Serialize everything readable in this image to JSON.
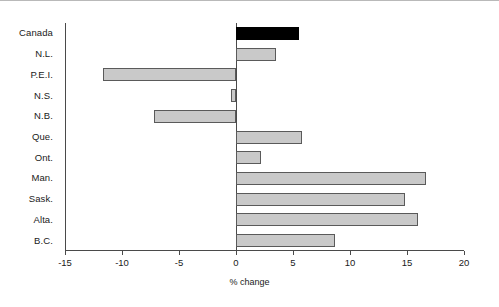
{
  "chart_data": {
    "type": "bar",
    "orientation": "horizontal",
    "title": "",
    "xlabel": "% change",
    "ylabel": "",
    "xlim": [
      -15,
      20
    ],
    "xticks": [
      -15,
      -10,
      -5,
      0,
      5,
      10,
      15,
      20
    ],
    "xtick_labels": [
      "-15",
      "-10",
      "-5",
      "0",
      "5",
      "10",
      "15",
      "20"
    ],
    "grid": false,
    "legend": false,
    "zero_reference": 0,
    "highlight_category": "Canada",
    "colors": {
      "bar_fill": "#c9c9c9",
      "bar_edge": "#5a5a5a",
      "highlight_fill": "#000000",
      "axis": "#4a4a4a",
      "text": "#1a1a1a"
    },
    "categories": [
      "Canada",
      "N.L.",
      "P.E.I.",
      "N.S.",
      "N.B.",
      "Que.",
      "Ont.",
      "Man.",
      "Sask.",
      "Alta.",
      "B.C."
    ],
    "values": [
      5.5,
      3.5,
      -11.7,
      -0.4,
      -7.2,
      5.8,
      2.2,
      16.7,
      14.8,
      16.0,
      8.7
    ]
  }
}
